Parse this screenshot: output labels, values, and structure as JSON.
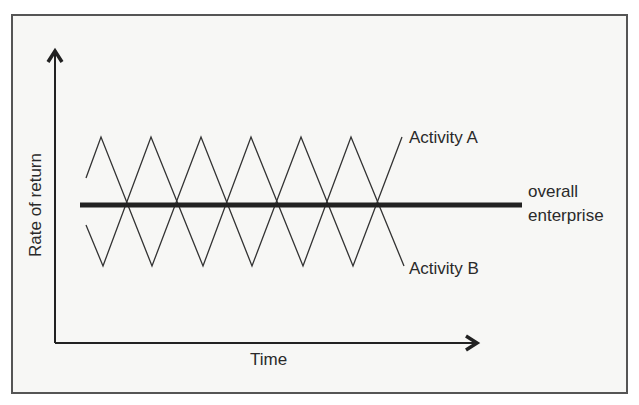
{
  "diagram": {
    "axes": {
      "y_label": "Rate of return",
      "x_label": "Time"
    },
    "series": [
      {
        "name": "Activity A",
        "label": "Activity A",
        "style": "thin zigzag, oscillating above and below the enterprise line"
      },
      {
        "name": "Activity B",
        "label": "Activity B",
        "style": "thin zigzag, mirror image of Activity A"
      },
      {
        "name": "overall enterprise",
        "label_line1": "overall",
        "label_line2": "enterprise",
        "style": "thick flat horizontal line"
      }
    ],
    "colors": {
      "background": "#f7f7f5",
      "frame": "#555555",
      "lines": "#333333",
      "thick_line": "#222222",
      "text": "#2a2a2a"
    }
  }
}
